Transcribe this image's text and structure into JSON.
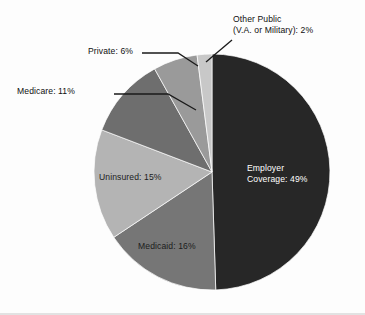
{
  "chart_data": {
    "type": "pie",
    "title": "",
    "subtitle": "",
    "xlabel": "",
    "ylabel": "",
    "legend_position": "none",
    "grid": false,
    "start_angle_deg": 0,
    "direction": "clockwise",
    "center": {
      "x": 212,
      "y": 172
    },
    "radius": 118,
    "categories": [
      "Employer Coverage",
      "Medicaid",
      "Uninsured",
      "Medicare",
      "Private",
      "Other Public (V.A. or Military)"
    ],
    "values": [
      49,
      16,
      15,
      11,
      6,
      2
    ],
    "units": "percent",
    "slices": [
      {
        "name": "Employer Coverage",
        "label": "Employer\nCoverage: 49%",
        "label_line1": "Employer",
        "label_line2": "Coverage: 49%",
        "value": 49,
        "value_text": "49%",
        "color": "#272727",
        "label_placement": "inside",
        "label_color": "#ffffff",
        "start_deg": 0,
        "end_deg": 176.4
      },
      {
        "name": "Medicaid",
        "label": "Medicaid: 16%",
        "value": 16,
        "value_text": "16%",
        "color": "#767676",
        "label_placement": "inside",
        "label_color": "#1c1c1c",
        "start_deg": 176.4,
        "end_deg": 234.0
      },
      {
        "name": "Uninsured",
        "label": "Uninsured: 15%",
        "value": 15,
        "value_text": "15%",
        "color": "#b4b4b4",
        "label_placement": "inside",
        "label_color": "#1c1c1c",
        "start_deg": 234.0,
        "end_deg": 288.0
      },
      {
        "name": "Medicare",
        "label": "Medicare: 11%",
        "value": 11,
        "value_text": "11%",
        "color": "#6e6e6e",
        "label_placement": "outside",
        "label_color": "#101010",
        "start_deg": 288.0,
        "end_deg": 327.6
      },
      {
        "name": "Private",
        "label": "Private: 6%",
        "value": 6,
        "value_text": "6%",
        "color": "#9a9a9a",
        "label_placement": "outside",
        "label_color": "#101010",
        "start_deg": 327.6,
        "end_deg": 349.2
      },
      {
        "name": "Other Public (V.A. or Military)",
        "label": "Other Public\n(V.A. or Military): 2%",
        "label_line1": "Other Public",
        "label_line2": "(V.A. or Military): 2%",
        "value": 2,
        "value_text": "2%",
        "color": "#c8c8c8",
        "label_placement": "outside",
        "label_color": "#101010",
        "start_deg": 349.2,
        "end_deg": 360.0
      }
    ],
    "annotations": [
      {
        "name": "medicare-leader-line",
        "from": "Medicare slice edge",
        "to": "Medicare: 11% label"
      },
      {
        "name": "private-leader-line",
        "from": "Private slice edge",
        "to": "Private: 6% label"
      },
      {
        "name": "other-public-leader-line",
        "from": "Other Public slice edge",
        "to": "Other Public (V.A. or Military): 2% label"
      }
    ]
  },
  "labels": {
    "employer_line1": "Employer",
    "employer_line2": "Coverage: 49%",
    "medicaid": "Medicaid: 16%",
    "uninsured": "Uninsured: 15%",
    "medicare": "Medicare: 11%",
    "private": "Private: 6%",
    "other_public_line1": "Other Public",
    "other_public_line2": "(V.A. or Military): 2%"
  },
  "colors": {
    "employer": "#272727",
    "medicaid": "#767676",
    "uninsured": "#b4b4b4",
    "medicare": "#6e6e6e",
    "private": "#9a9a9a",
    "other_public": "#c8c8c8",
    "background": "#fdfdfd",
    "leader_line": "#1a1a1a"
  }
}
